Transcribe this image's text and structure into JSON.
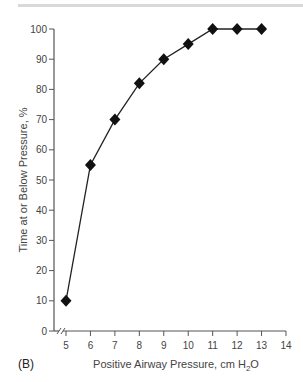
{
  "chart_data": {
    "type": "line",
    "title": "",
    "panel_label": "(B)",
    "xlabel": "Positive Airway Pressure, cm H2O",
    "xlabel_main": "Positive Airway Pressure, cm H",
    "xlabel_sub": "2",
    "xlabel_tail": "O",
    "ylabel": "Time at or Below Pressure, %",
    "x": [
      5,
      6,
      7,
      8,
      9,
      10,
      11,
      12,
      13
    ],
    "series": [
      {
        "name": "Time at or Below Pressure",
        "values": [
          10,
          55,
          70,
          82,
          90,
          95,
          100,
          100,
          100
        ]
      }
    ],
    "xlim": [
      5,
      14
    ],
    "ylim": [
      0,
      100
    ],
    "xticks": [
      5,
      6,
      7,
      8,
      9,
      10,
      11,
      12,
      13,
      14
    ],
    "yticks": [
      0,
      10,
      20,
      30,
      40,
      50,
      60,
      70,
      80,
      90,
      100
    ],
    "marker": "diamond",
    "axis_break": true,
    "grid": false,
    "legend": null
  }
}
